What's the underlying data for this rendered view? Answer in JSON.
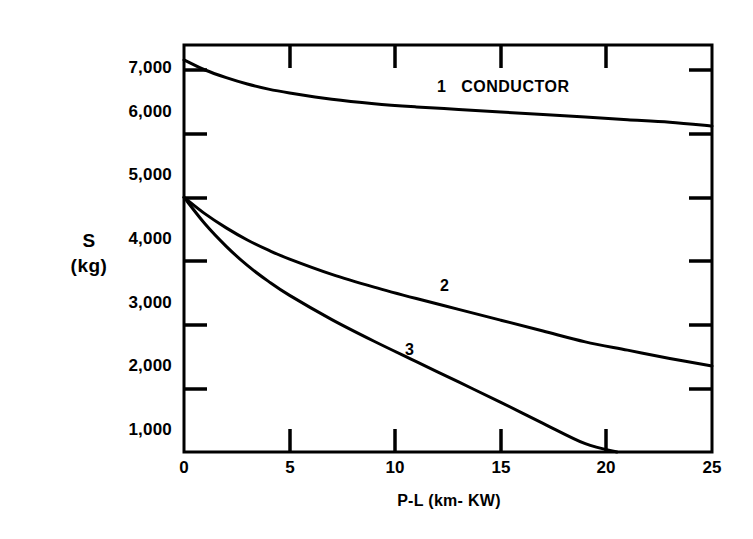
{
  "chart_data": {
    "type": "line",
    "title": "",
    "xlabel": "P-L  (km- KW)",
    "ylabel_lines": [
      "S",
      "(kg)"
    ],
    "xlim": [
      0,
      25
    ],
    "ylim": [
      1000,
      7400
    ],
    "xticks": [
      0,
      5,
      10,
      15,
      20,
      25
    ],
    "xtick_labels": [
      "0",
      "5",
      "10",
      "15",
      "20",
      "25"
    ],
    "yticks": [
      1000,
      2000,
      3000,
      4000,
      5000,
      6000,
      7000
    ],
    "ytick_labels": [
      "1,000",
      "2,000",
      "3,000",
      "4,000",
      "5,000",
      "6,000",
      "7,000"
    ],
    "grid": false,
    "legend_position": "inline-annotations",
    "frame": "box",
    "line_color": "#000000",
    "background": "#ffffff",
    "series": [
      {
        "name": "1 CONDUCTOR",
        "annotation": "1   CONDUCTOR",
        "x": [
          0,
          1,
          2,
          3,
          4,
          5,
          7,
          9,
          11,
          13,
          15,
          17,
          19,
          21,
          23,
          25
        ],
        "values": [
          7160,
          7000,
          6880,
          6780,
          6700,
          6640,
          6540,
          6470,
          6420,
          6380,
          6340,
          6300,
          6260,
          6220,
          6180,
          6120
        ]
      },
      {
        "name": "2",
        "annotation": "2",
        "x": [
          0,
          1,
          2,
          3,
          4,
          5,
          7,
          9,
          11,
          13,
          15,
          17,
          19,
          21,
          23,
          25
        ],
        "values": [
          5000,
          4740,
          4520,
          4330,
          4170,
          4030,
          3790,
          3590,
          3410,
          3240,
          3070,
          2900,
          2730,
          2600,
          2470,
          2350
        ]
      },
      {
        "name": "3",
        "annotation": "3",
        "x": [
          0,
          1,
          2,
          3,
          4,
          5,
          7,
          9,
          11,
          13,
          15,
          17,
          19,
          20.5
        ],
        "values": [
          5000,
          4580,
          4230,
          3930,
          3680,
          3460,
          3080,
          2740,
          2420,
          2100,
          1780,
          1450,
          1130,
          1000
        ]
      }
    ],
    "annotations": [
      {
        "text": "1   CONDUCTOR",
        "x": 13.0,
        "y": 6560
      },
      {
        "text": "2",
        "x": 12.6,
        "y": 3520
      },
      {
        "text": "3",
        "x": 11.2,
        "y": 2480
      }
    ]
  }
}
